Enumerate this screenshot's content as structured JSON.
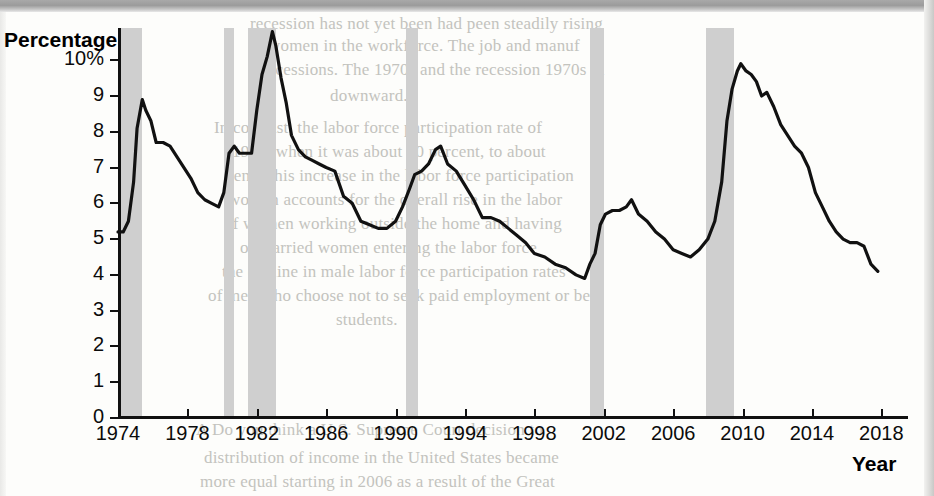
{
  "figure": {
    "y_axis_title": "Percentage",
    "x_axis_title": "Year"
  },
  "scan_artifacts": {
    "bleed_text": [
      {
        "text": "recession has not yet been had peen steadily rising",
        "x": 250,
        "y": 14,
        "size": 17
      },
      {
        "text": "women in the workforce. The job and manuf",
        "x": 268,
        "y": 36,
        "size": 17
      },
      {
        "text": "recessions. The 1970s and the recession 1970s in",
        "x": 262,
        "y": 60,
        "size": 17
      },
      {
        "text": "downward.",
        "x": 330,
        "y": 86,
        "size": 17
      },
      {
        "text": "In contrast, the labor force participation rate of",
        "x": 214,
        "y": 118,
        "size": 17
      },
      {
        "text": "1970, when it was about 40 percent, to about",
        "x": 232,
        "y": 142,
        "size": 17
      },
      {
        "text": "cent. This increase in the labor force participation",
        "x": 226,
        "y": 166,
        "size": 17
      },
      {
        "text": "women accounts for the overall rise in the labor",
        "x": 228,
        "y": 190,
        "size": 17
      },
      {
        "text": "of women working outside the home and having",
        "x": 224,
        "y": 214,
        "size": 17
      },
      {
        "text": "of married women entering the labor force",
        "x": 240,
        "y": 238,
        "size": 17
      },
      {
        "text": "the decline in male labor force participation rates",
        "x": 222,
        "y": 262,
        "size": 17
      },
      {
        "text": "of men who choose not to seek paid employment or be",
        "x": 208,
        "y": 286,
        "size": 17
      },
      {
        "text": "students.",
        "x": 336,
        "y": 310,
        "size": 17
      },
      {
        "text": "A Do you think a U.S. Supreme Court decision to",
        "x": 196,
        "y": 420,
        "size": 17
      },
      {
        "text": "distribution of income in the United States became",
        "x": 204,
        "y": 448,
        "size": 17
      },
      {
        "text": "more equal starting in 2006 as a result of the Great",
        "x": 200,
        "y": 472,
        "size": 17
      }
    ]
  },
  "chart_data": {
    "type": "line",
    "title": "",
    "subtitle": "",
    "xlabel": "Year",
    "ylabel": "Percentage",
    "xlim": [
      1974,
      2018.5
    ],
    "ylim": [
      0,
      10.9
    ],
    "grid": false,
    "legend": "none",
    "y_tick_labels": [
      "0",
      "1",
      "2",
      "3",
      "4",
      "5",
      "6",
      "7",
      "8",
      "9",
      "10%"
    ],
    "y_tick_values": [
      0,
      1,
      2,
      3,
      4,
      5,
      6,
      7,
      8,
      9,
      10
    ],
    "x_tick_labels": [
      "1974",
      "1978",
      "1982",
      "1986",
      "1990",
      "1994",
      "1998",
      "2002",
      "2006",
      "2010",
      "2014",
      "2018"
    ],
    "x_tick_values": [
      1974,
      1978,
      1982,
      1986,
      1990,
      1994,
      1998,
      2002,
      2006,
      2010,
      2014,
      2018
    ],
    "line_color": "#111111",
    "recession_band_color": "#cfcfcf",
    "series": [
      {
        "name": "Unemployment rate",
        "x": [
          1974.0,
          1974.3,
          1974.6,
          1974.9,
          1975.1,
          1975.4,
          1975.6,
          1975.9,
          1976.2,
          1976.6,
          1977.0,
          1977.4,
          1977.8,
          1978.2,
          1978.6,
          1979.0,
          1979.4,
          1979.8,
          1980.1,
          1980.4,
          1980.7,
          1981.0,
          1981.4,
          1981.7,
          1982.0,
          1982.3,
          1982.6,
          1982.9,
          1983.1,
          1983.4,
          1983.7,
          1984.0,
          1984.4,
          1984.8,
          1985.2,
          1985.6,
          1986.0,
          1986.5,
          1987.0,
          1987.5,
          1988.0,
          1988.5,
          1989.0,
          1989.5,
          1990.0,
          1990.4,
          1990.8,
          1991.1,
          1991.5,
          1991.9,
          1992.3,
          1992.6,
          1993.0,
          1993.5,
          1994.0,
          1994.5,
          1995.0,
          1995.5,
          1996.0,
          1996.5,
          1997.0,
          1997.5,
          1998.0,
          1998.6,
          1999.2,
          1999.8,
          2000.4,
          2000.9,
          2001.2,
          2001.5,
          2001.8,
          2002.1,
          2002.5,
          2002.9,
          2003.3,
          2003.6,
          2004.0,
          2004.5,
          2005.0,
          2005.5,
          2006.0,
          2006.5,
          2007.0,
          2007.5,
          2008.0,
          2008.4,
          2008.8,
          2009.1,
          2009.4,
          2009.7,
          2009.9,
          2010.2,
          2010.5,
          2010.8,
          2011.1,
          2011.4,
          2011.8,
          2012.2,
          2012.6,
          2013.0,
          2013.4,
          2013.8,
          2014.2,
          2014.6,
          2015.0,
          2015.4,
          2015.8,
          2016.2,
          2016.6,
          2017.0,
          2017.4,
          2017.8
        ],
        "values": [
          5.2,
          5.2,
          5.5,
          6.6,
          8.1,
          8.9,
          8.6,
          8.3,
          7.7,
          7.7,
          7.6,
          7.3,
          7.0,
          6.7,
          6.3,
          6.1,
          6.0,
          5.9,
          6.3,
          7.4,
          7.6,
          7.4,
          7.4,
          7.4,
          8.6,
          9.6,
          10.1,
          10.8,
          10.4,
          9.5,
          8.8,
          7.9,
          7.5,
          7.3,
          7.2,
          7.1,
          7.0,
          6.9,
          6.2,
          6.0,
          5.5,
          5.4,
          5.3,
          5.3,
          5.5,
          5.9,
          6.4,
          6.8,
          6.9,
          7.1,
          7.5,
          7.6,
          7.1,
          6.9,
          6.5,
          6.1,
          5.6,
          5.6,
          5.5,
          5.3,
          5.1,
          4.9,
          4.6,
          4.5,
          4.3,
          4.2,
          4.0,
          3.9,
          4.3,
          4.6,
          5.4,
          5.7,
          5.8,
          5.8,
          5.9,
          6.1,
          5.7,
          5.5,
          5.2,
          5.0,
          4.7,
          4.6,
          4.5,
          4.7,
          5.0,
          5.5,
          6.6,
          8.3,
          9.2,
          9.7,
          9.9,
          9.7,
          9.6,
          9.4,
          9.0,
          9.1,
          8.7,
          8.2,
          7.9,
          7.6,
          7.4,
          7.0,
          6.3,
          5.9,
          5.5,
          5.2,
          5.0,
          4.9,
          4.9,
          4.8,
          4.3,
          4.1
        ]
      }
    ],
    "recession_bands": [
      {
        "start": 1974.0,
        "end": 1975.4
      },
      {
        "start": 1980.1,
        "end": 1980.7
      },
      {
        "start": 1981.5,
        "end": 1983.1
      },
      {
        "start": 1990.6,
        "end": 1991.3
      },
      {
        "start": 2001.2,
        "end": 2002.0
      },
      {
        "start": 2007.9,
        "end": 2009.5
      }
    ]
  }
}
